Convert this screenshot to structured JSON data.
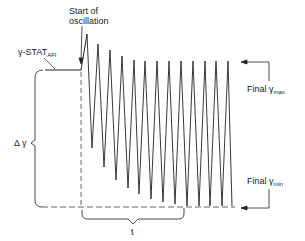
{
  "labels": {
    "start_line1": "Start of",
    "start_line2": "oscillation",
    "gamma_stat": "γ-STAT",
    "gamma_stat_sub": "AFI",
    "delta_gamma": "Δ γ",
    "final_max": "Final",
    "final_max_symbol": "γ",
    "final_max_sub": "max",
    "final_min": "Final",
    "final_min_symbol": "γ",
    "final_min_sub": "min",
    "t": "t"
  },
  "colors": {
    "line": "#222222",
    "dashed": "#555555",
    "background": "#ffffff"
  },
  "oscillation": {
    "peaks": [
      [
        87,
        34
      ],
      [
        98,
        44
      ],
      [
        110,
        50
      ],
      [
        122,
        56
      ],
      [
        134,
        60
      ],
      [
        145,
        61
      ],
      [
        157,
        61
      ],
      [
        169,
        61
      ],
      [
        181,
        61
      ],
      [
        193,
        61
      ],
      [
        205,
        61
      ],
      [
        216,
        61
      ],
      [
        228,
        61
      ]
    ],
    "troughs": [
      [
        92,
        148
      ],
      [
        104,
        167
      ],
      [
        116,
        180
      ],
      [
        128,
        188
      ],
      [
        139,
        194
      ],
      [
        151,
        199
      ],
      [
        163,
        202
      ],
      [
        175,
        204
      ],
      [
        187,
        206
      ],
      [
        199,
        206
      ],
      [
        210,
        206
      ],
      [
        222,
        206
      ]
    ]
  }
}
